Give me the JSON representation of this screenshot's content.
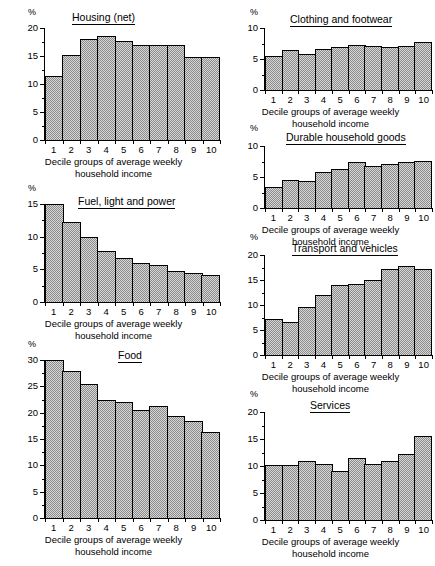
{
  "figure": {
    "axis_unit_label": "%",
    "x_axis_caption": "Decile groups of average weekly\nhousehold income",
    "decile_labels": [
      "1",
      "2",
      "3",
      "4",
      "5",
      "6",
      "7",
      "8",
      "9",
      "10"
    ],
    "colors": {
      "ink": "#000000",
      "bar_fill_light": "#d8d8d8",
      "bar_fill_dither": "#8a8a8a",
      "background": "#ffffff"
    }
  },
  "chart_data": [
    {
      "id": "housing-net",
      "type": "bar",
      "title": "Housing (net)",
      "xlabel": "Decile groups of average weekly household income",
      "ylabel": "%",
      "categories": [
        "1",
        "2",
        "3",
        "4",
        "5",
        "6",
        "7",
        "8",
        "9",
        "10"
      ],
      "values": [
        11.5,
        15.1,
        18.0,
        18.5,
        17.7,
        16.9,
        16.9,
        17.0,
        14.9,
        14.9
      ],
      "ylim": [
        0,
        20
      ],
      "yticks": [
        0,
        5,
        10,
        15,
        20
      ],
      "ytick_labels": [
        "0",
        "5",
        "10",
        "15",
        "20"
      ],
      "grid": false,
      "legend": "none"
    },
    {
      "id": "fuel-light-power",
      "type": "bar",
      "title": "Fuel, light and power",
      "xlabel": "Decile groups of average weekly household income",
      "ylabel": "%",
      "categories": [
        "1",
        "2",
        "3",
        "4",
        "5",
        "6",
        "7",
        "8",
        "9",
        "10"
      ],
      "values": [
        15.0,
        12.3,
        9.9,
        7.8,
        6.7,
        6.0,
        5.7,
        4.8,
        4.5,
        4.2
      ],
      "ylim": [
        0,
        15
      ],
      "yticks": [
        0,
        5,
        10,
        15
      ],
      "ytick_labels": [
        "0",
        "5",
        "10",
        "15"
      ],
      "grid": false,
      "legend": "none"
    },
    {
      "id": "food",
      "type": "bar",
      "title": "Food",
      "xlabel": "Decile groups of average weekly household income",
      "ylabel": "%",
      "categories": [
        "1",
        "2",
        "3",
        "4",
        "5",
        "6",
        "7",
        "8",
        "9",
        "10"
      ],
      "values": [
        30.0,
        28.0,
        25.5,
        22.5,
        22.0,
        20.6,
        21.3,
        19.3,
        18.4,
        16.4
      ],
      "ylim": [
        0,
        30
      ],
      "yticks": [
        0,
        5,
        10,
        15,
        20,
        25,
        30
      ],
      "ytick_labels": [
        "0",
        "5",
        "10",
        "15",
        "20",
        "25",
        "30"
      ],
      "grid": false,
      "legend": "none"
    },
    {
      "id": "clothing-footwear",
      "type": "bar",
      "title": "Clothing and footwear",
      "xlabel": "Decile groups of average weekly household income",
      "ylabel": "%",
      "categories": [
        "1",
        "2",
        "3",
        "4",
        "5",
        "6",
        "7",
        "8",
        "9",
        "10"
      ],
      "values": [
        5.5,
        6.5,
        5.8,
        6.6,
        7.0,
        7.3,
        7.1,
        7.0,
        7.1,
        7.7
      ],
      "ylim": [
        0,
        10
      ],
      "yticks": [
        0,
        5,
        10
      ],
      "ytick_labels": [
        "0",
        "5",
        "10"
      ],
      "grid": false,
      "legend": "none"
    },
    {
      "id": "durable-household-goods",
      "type": "bar",
      "title": "Durable household goods",
      "xlabel": "Decile groups of average weekly household income",
      "ylabel": "%",
      "categories": [
        "1",
        "2",
        "3",
        "4",
        "5",
        "6",
        "7",
        "8",
        "9",
        "10"
      ],
      "values": [
        3.4,
        4.5,
        4.3,
        5.8,
        6.3,
        7.5,
        6.8,
        7.1,
        7.5,
        7.6
      ],
      "ylim": [
        0,
        10
      ],
      "yticks": [
        0,
        5,
        10
      ],
      "ytick_labels": [
        "0",
        "5",
        "10"
      ],
      "grid": false,
      "legend": "none"
    },
    {
      "id": "transport-vehicles",
      "type": "bar",
      "title": "Transport and vehicles",
      "xlabel": "Decile groups of average weekly household income",
      "ylabel": "%",
      "categories": [
        "1",
        "2",
        "3",
        "4",
        "5",
        "6",
        "7",
        "8",
        "9",
        "10"
      ],
      "values": [
        7.2,
        6.6,
        9.6,
        12.0,
        14.1,
        14.3,
        15.1,
        17.2,
        17.9,
        17.3
      ],
      "ylim": [
        0,
        20
      ],
      "yticks": [
        0,
        5,
        10,
        15,
        20
      ],
      "ytick_labels": [
        "0",
        "5",
        "10",
        "15",
        "20"
      ],
      "grid": false,
      "legend": "none"
    },
    {
      "id": "services",
      "type": "bar",
      "title": "Services",
      "xlabel": "Decile groups of average weekly household income",
      "ylabel": "%",
      "categories": [
        "1",
        "2",
        "3",
        "4",
        "5",
        "6",
        "7",
        "8",
        "9",
        "10"
      ],
      "values": [
        10.2,
        10.2,
        11.0,
        10.3,
        9.1,
        11.5,
        10.4,
        10.9,
        12.3,
        15.5
      ],
      "ylim": [
        0,
        20
      ],
      "yticks": [
        0,
        5,
        10,
        15,
        20
      ],
      "ytick_labels": [
        "0",
        "5",
        "10",
        "15",
        "20"
      ],
      "grid": false,
      "legend": "none"
    }
  ],
  "layout": {
    "charts": [
      {
        "id": "housing-net",
        "left": 6,
        "top": 4,
        "width": 215,
        "height": 175,
        "plot_left": 38,
        "plot_top": 24,
        "plot_width": 175,
        "plot_height": 112,
        "title_left": 66,
        "title_top": 8,
        "pct_left": 22,
        "pct_top": 4,
        "caption_top": 152
      },
      {
        "id": "fuel-light-power",
        "left": 6,
        "top": 182,
        "width": 215,
        "height": 175,
        "plot_left": 38,
        "plot_top": 22,
        "plot_width": 175,
        "plot_height": 98,
        "title_left": 72,
        "title_top": 14,
        "pct_left": 22,
        "pct_top": 2,
        "caption_top": 136
      },
      {
        "id": "food",
        "left": 6,
        "top": 338,
        "width": 215,
        "height": 226,
        "plot_left": 38,
        "plot_top": 22,
        "plot_width": 175,
        "plot_height": 158,
        "title_left": 112,
        "title_top": 12,
        "pct_left": 22,
        "pct_top": 2,
        "caption_top": 196
      },
      {
        "id": "clothing-footwear",
        "left": 228,
        "top": 4,
        "width": 205,
        "height": 120,
        "plot_left": 36,
        "plot_top": 24,
        "plot_width": 167,
        "plot_height": 62,
        "title_left": 62,
        "title_top": 10,
        "pct_left": 22,
        "pct_top": 4,
        "caption_top": 102
      },
      {
        "id": "durable-household-goods",
        "left": 228,
        "top": 124,
        "width": 205,
        "height": 118,
        "plot_left": 36,
        "plot_top": 22,
        "plot_width": 167,
        "plot_height": 62,
        "title_left": 58,
        "title_top": 8,
        "pct_left": 22,
        "pct_top": 0,
        "caption_top": 100
      },
      {
        "id": "transport-vehicles",
        "left": 228,
        "top": 237,
        "width": 205,
        "height": 148,
        "plot_left": 36,
        "plot_top": 18,
        "plot_width": 167,
        "plot_height": 100,
        "title_left": 64,
        "title_top": 6,
        "pct_left": 22,
        "pct_top": -4,
        "caption_top": 134
      },
      {
        "id": "services",
        "left": 228,
        "top": 390,
        "width": 205,
        "height": 172,
        "plot_left": 36,
        "plot_top": 22,
        "plot_width": 167,
        "plot_height": 108,
        "title_left": 82,
        "title_top": 10,
        "pct_left": 22,
        "pct_top": 0,
        "caption_top": 146
      }
    ]
  }
}
